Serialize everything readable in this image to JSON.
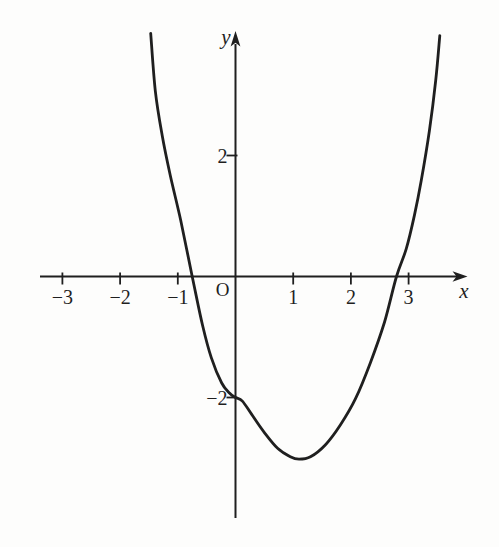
{
  "figure": {
    "background": "#fdfdfc",
    "ink": "#1f1f1f"
  },
  "chart_data": {
    "type": "line",
    "title": "",
    "xlabel": "x",
    "ylabel": "y",
    "origin_label": "O",
    "grid": false,
    "legend": false,
    "x_axis": {
      "range_shown": [
        -3.4,
        4.0
      ],
      "arrow": true,
      "ticks": [
        {
          "value": -3,
          "label": "−3"
        },
        {
          "value": -2,
          "label": "−2"
        },
        {
          "value": -1,
          "label": "−1"
        },
        {
          "value": 1,
          "label": "1"
        },
        {
          "value": 2,
          "label": "2"
        },
        {
          "value": 3,
          "label": "3"
        }
      ]
    },
    "y_axis": {
      "range_shown": [
        -4.0,
        4.0
      ],
      "arrow": true,
      "ticks": [
        {
          "value": 2,
          "label": "2"
        },
        {
          "value": -2,
          "label": "−2"
        }
      ]
    },
    "series": [
      {
        "name": "curve",
        "points": [
          [
            -1.47,
            4.02
          ],
          [
            -1.39,
            3.07
          ],
          [
            -1.27,
            2.33
          ],
          [
            -1.13,
            1.67
          ],
          [
            -0.95,
            0.93
          ],
          [
            -0.75,
            0.0
          ],
          [
            -0.57,
            -0.81
          ],
          [
            -0.42,
            -1.34
          ],
          [
            -0.24,
            -1.76
          ],
          [
            -0.1,
            -1.93
          ],
          [
            0.0,
            -2.0
          ],
          [
            0.12,
            -2.06
          ],
          [
            0.28,
            -2.28
          ],
          [
            0.5,
            -2.58
          ],
          [
            0.73,
            -2.84
          ],
          [
            0.95,
            -2.98
          ],
          [
            1.1,
            -3.02
          ],
          [
            1.3,
            -2.98
          ],
          [
            1.56,
            -2.78
          ],
          [
            1.82,
            -2.45
          ],
          [
            2.08,
            -2.02
          ],
          [
            2.34,
            -1.42
          ],
          [
            2.58,
            -0.76
          ],
          [
            2.79,
            0.0
          ],
          [
            2.96,
            0.46
          ],
          [
            3.1,
            1.01
          ],
          [
            3.22,
            1.59
          ],
          [
            3.36,
            2.41
          ],
          [
            3.47,
            3.24
          ],
          [
            3.54,
            3.98
          ]
        ]
      }
    ],
    "key_points_approx": {
      "x_intercepts": [
        -0.75,
        2.79
      ],
      "y_intercept": [
        0,
        -2
      ],
      "local_minimum": [
        1.1,
        -3.0
      ]
    }
  }
}
